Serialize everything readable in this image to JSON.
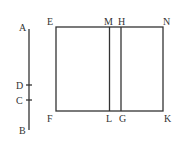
{
  "diagram": {
    "labels": {
      "A": "A",
      "B": "B",
      "C": "C",
      "D": "D",
      "E": "E",
      "F": "F",
      "G": "G",
      "H": "H",
      "K": "K",
      "L": "L",
      "M": "M",
      "N": "N"
    },
    "line_AB": {
      "x": 29,
      "y1": 29,
      "y2": 130,
      "ticks": [
        {
          "label": "D",
          "y": 85
        },
        {
          "label": "C",
          "y": 100
        }
      ]
    },
    "rectangle_EFKN": {
      "left": 56,
      "top": 27,
      "right": 163,
      "bottom": 111
    },
    "inner_lines": [
      {
        "name": "ML",
        "x": 109.5
      },
      {
        "name": "HG",
        "x": 121
      }
    ],
    "colors": {
      "stroke": "#333333",
      "background": "#ffffff"
    }
  }
}
